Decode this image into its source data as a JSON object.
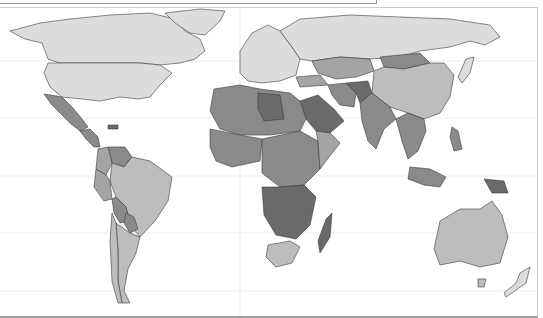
{
  "map": {
    "type": "choropleth",
    "projection": "world",
    "colors": {
      "level_1": "#dcdcdc",
      "level_2": "#bdbdbd",
      "level_3": "#a4a4a4",
      "level_4": "#8a8a8a",
      "level_5": "#6a6a6a",
      "ocean": "#ffffff",
      "border": "#3a3a3a"
    },
    "regions": [
      {
        "name": "Canada",
        "level": 1
      },
      {
        "name": "United States",
        "level": 1
      },
      {
        "name": "Greenland",
        "level": 1
      },
      {
        "name": "Mexico",
        "level": 4
      },
      {
        "name": "Central America",
        "level": 4
      },
      {
        "name": "Venezuela",
        "level": 4
      },
      {
        "name": "Colombia",
        "level": 3
      },
      {
        "name": "Brazil",
        "level": 2
      },
      {
        "name": "Peru",
        "level": 3
      },
      {
        "name": "Bolivia",
        "level": 4
      },
      {
        "name": "Paraguay",
        "level": 4
      },
      {
        "name": "Argentina",
        "level": 2
      },
      {
        "name": "Chile",
        "level": 2
      },
      {
        "name": "Europe",
        "level": 1
      },
      {
        "name": "Russia",
        "level": 1
      },
      {
        "name": "Kazakhstan",
        "level": 3
      },
      {
        "name": "Mongolia",
        "level": 4
      },
      {
        "name": "China",
        "level": 2
      },
      {
        "name": "Japan",
        "level": 1
      },
      {
        "name": "North Africa",
        "level": 4
      },
      {
        "name": "Libya",
        "level": 5
      },
      {
        "name": "West Africa",
        "level": 4
      },
      {
        "name": "Central Africa",
        "level": 4
      },
      {
        "name": "East Africa",
        "level": 4
      },
      {
        "name": "Southern Africa",
        "level": 5
      },
      {
        "name": "South Africa",
        "level": 2
      },
      {
        "name": "Madagascar",
        "level": 5
      },
      {
        "name": "Saudi Arabia",
        "level": 5
      },
      {
        "name": "Iran",
        "level": 4
      },
      {
        "name": "Afghanistan",
        "level": 5
      },
      {
        "name": "India",
        "level": 4
      },
      {
        "name": "Southeast Asia",
        "level": 4
      },
      {
        "name": "Indonesia",
        "level": 4
      },
      {
        "name": "Papua New Guinea",
        "level": 5
      },
      {
        "name": "Australia",
        "level": 2
      },
      {
        "name": "New Zealand",
        "level": 1
      }
    ]
  }
}
